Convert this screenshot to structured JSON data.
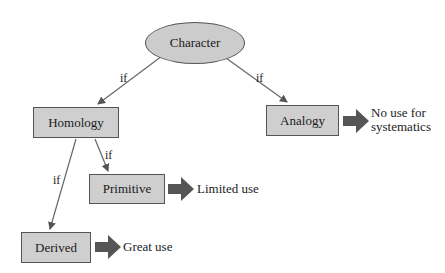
{
  "nodes": {
    "character": "Character",
    "homology": "Homology",
    "analogy": "Analogy",
    "primitive": "Primitive",
    "derived": "Derived"
  },
  "edge_labels": {
    "character_to_homology": "if",
    "character_to_analogy": "if",
    "homology_to_primitive": "if",
    "homology_to_derived": "if"
  },
  "outcomes": {
    "analogy_line1": "No use for",
    "analogy_line2": "systematics",
    "primitive": "Limited use",
    "derived": "Great use"
  },
  "colors": {
    "node_fill": "#cfcfcf",
    "node_border": "#555555",
    "arrow": "#555555",
    "fat_arrow": "#555555"
  }
}
